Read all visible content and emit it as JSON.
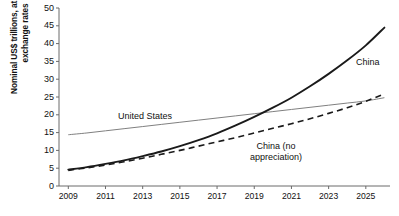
{
  "chart_data": {
    "type": "line",
    "title": "",
    "xlabel": "",
    "ylabel_line1": "Nominal US$ trillions, at market",
    "ylabel_line2": "exchange rates",
    "ylim": [
      0,
      50
    ],
    "xlim": [
      2008.5,
      2026.3
    ],
    "ytick_labels": [
      "0",
      "5",
      "10",
      "15",
      "20",
      "25",
      "30",
      "35",
      "40",
      "45",
      "50"
    ],
    "ytick_values": [
      0,
      5,
      10,
      15,
      20,
      25,
      30,
      35,
      40,
      45,
      50
    ],
    "xtick_labels": [
      "2009",
      "2011",
      "2013",
      "2015",
      "2017",
      "2019",
      "2021",
      "2023",
      "2025"
    ],
    "xtick_values": [
      2009,
      2011,
      2013,
      2015,
      2017,
      2019,
      2021,
      2023,
      2025
    ],
    "grid": false,
    "legend_position": "inline-annotations",
    "series": [
      {
        "name": "United States",
        "style": "solid-thin-gray",
        "color": "#808080",
        "x": [
          2009,
          2010,
          2011,
          2012,
          2013,
          2014,
          2015,
          2016,
          2017,
          2018,
          2019,
          2020,
          2021,
          2022,
          2023,
          2024,
          2025,
          2026
        ],
        "values": [
          14.4,
          14.9,
          15.5,
          16.1,
          16.7,
          17.3,
          17.9,
          18.5,
          19.1,
          19.7,
          20.3,
          20.9,
          21.5,
          22.1,
          22.7,
          23.3,
          23.9,
          24.8
        ]
      },
      {
        "name": "China",
        "style": "solid-thick-black",
        "color": "#1a1a1a",
        "x": [
          2009,
          2010,
          2011,
          2012,
          2013,
          2014,
          2015,
          2016,
          2017,
          2018,
          2019,
          2020,
          2021,
          2022,
          2023,
          2024,
          2025,
          2026
        ],
        "values": [
          4.6,
          5.3,
          6.2,
          7.2,
          8.4,
          9.7,
          11.2,
          12.9,
          14.8,
          17.0,
          19.4,
          22.0,
          24.8,
          28.0,
          31.5,
          35.3,
          39.5,
          44.5
        ]
      },
      {
        "name": "China (no appreciation)",
        "style": "dashed-black",
        "color": "#1a1a1a",
        "x": [
          2009,
          2010,
          2011,
          2012,
          2013,
          2014,
          2015,
          2016,
          2017,
          2018,
          2019,
          2020,
          2021,
          2022,
          2023,
          2024,
          2025,
          2026
        ],
        "values": [
          4.4,
          5.1,
          5.9,
          6.8,
          7.8,
          8.9,
          10.0,
          11.2,
          12.4,
          13.6,
          14.9,
          16.2,
          17.5,
          18.9,
          20.4,
          22.0,
          23.8,
          25.9
        ]
      }
    ],
    "annotations": [
      {
        "name": "china-label",
        "text": "China"
      },
      {
        "name": "united-states-label",
        "text": "United States"
      },
      {
        "name": "china-no-appreciation-label-line1",
        "text": "China (no"
      },
      {
        "name": "china-no-appreciation-label-line2",
        "text": "appreciation)"
      }
    ]
  }
}
